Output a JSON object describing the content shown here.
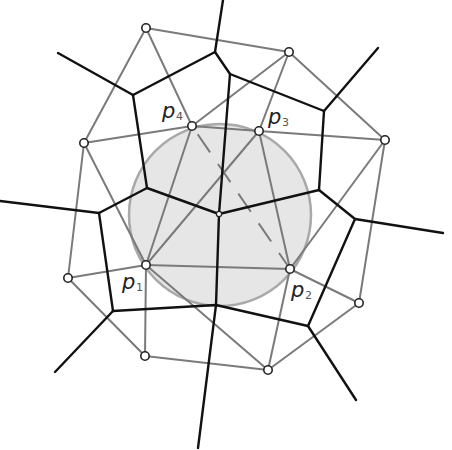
{
  "colors": {
    "voronoi": "#111111",
    "delaunay": "#7a7a7a",
    "circle_fill": "#e6e6e6",
    "circle_stroke": "#a9a9a9",
    "site_fill": "#ffffff",
    "site_stroke": "#222222",
    "dashed": "#7a7a7a"
  },
  "circle": {
    "cx": 220,
    "cy": 215,
    "r": 91
  },
  "sites": [
    {
      "id": "s_top",
      "x": 146,
      "y": 28
    },
    {
      "id": "s_topright",
      "x": 289,
      "y": 52
    },
    {
      "id": "s_left",
      "x": 84,
      "y": 143
    },
    {
      "id": "p4",
      "x": 192,
      "y": 126
    },
    {
      "id": "p3",
      "x": 259,
      "y": 131
    },
    {
      "id": "s_right",
      "x": 385,
      "y": 140
    },
    {
      "id": "p1",
      "x": 146,
      "y": 265
    },
    {
      "id": "p2",
      "x": 290,
      "y": 269
    },
    {
      "id": "s_farleft",
      "x": 68,
      "y": 278
    },
    {
      "id": "s_farright",
      "x": 359,
      "y": 303
    },
    {
      "id": "s_bottomleft",
      "x": 145,
      "y": 356
    },
    {
      "id": "s_bottom",
      "x": 268,
      "y": 370
    }
  ],
  "labels": [
    {
      "text": "p",
      "sub": "4",
      "x": 162,
      "y": 118
    },
    {
      "text": "p",
      "sub": "3",
      "x": 268,
      "y": 124
    },
    {
      "text": "p",
      "sub": "1",
      "x": 122,
      "y": 289
    },
    {
      "text": "p",
      "sub": "2",
      "x": 291,
      "y": 297
    }
  ],
  "delaunay_edges": [
    [
      146,
      28,
      289,
      52
    ],
    [
      146,
      28,
      84,
      143
    ],
    [
      146,
      28,
      192,
      126
    ],
    [
      289,
      52,
      192,
      126
    ],
    [
      289,
      52,
      259,
      131
    ],
    [
      289,
      52,
      385,
      140
    ],
    [
      84,
      143,
      192,
      126
    ],
    [
      84,
      143,
      68,
      278
    ],
    [
      84,
      143,
      146,
      265
    ],
    [
      192,
      126,
      259,
      131
    ],
    [
      192,
      126,
      146,
      265
    ],
    [
      259,
      131,
      385,
      140
    ],
    [
      259,
      131,
      146,
      265
    ],
    [
      259,
      131,
      290,
      269
    ],
    [
      385,
      140,
      290,
      269
    ],
    [
      385,
      140,
      359,
      303
    ],
    [
      146,
      265,
      290,
      269
    ],
    [
      146,
      265,
      68,
      278
    ],
    [
      146,
      265,
      145,
      356
    ],
    [
      146,
      265,
      268,
      370
    ],
    [
      290,
      269,
      359,
      303
    ],
    [
      290,
      269,
      268,
      370
    ],
    [
      68,
      278,
      145,
      356
    ],
    [
      145,
      356,
      268,
      370
    ],
    [
      268,
      370,
      359,
      303
    ]
  ],
  "dashed_edge": [
    192,
    126,
    290,
    269
  ],
  "voronoi_edges": [
    [
      219,
      214,
      230,
      74
    ],
    [
      219,
      214,
      147,
      188
    ],
    [
      219,
      214,
      319,
      190
    ],
    [
      219,
      214,
      216,
      305
    ],
    [
      230,
      74,
      215,
      52
    ],
    [
      230,
      74,
      324,
      111
    ],
    [
      215,
      52,
      133,
      95
    ],
    [
      215,
      52,
      223,
      0
    ],
    [
      133,
      95,
      147,
      188
    ],
    [
      133,
      95,
      58,
      53
    ],
    [
      147,
      188,
      99,
      213
    ],
    [
      99,
      213,
      0,
      201
    ],
    [
      99,
      213,
      113,
      311
    ],
    [
      113,
      311,
      216,
      305
    ],
    [
      113,
      311,
      55,
      372
    ],
    [
      216,
      305,
      308,
      326
    ],
    [
      216,
      305,
      198,
      448
    ],
    [
      308,
      326,
      355,
      219
    ],
    [
      308,
      326,
      356,
      400
    ],
    [
      355,
      219,
      319,
      190
    ],
    [
      355,
      219,
      443,
      233
    ],
    [
      319,
      190,
      324,
      111
    ],
    [
      324,
      111,
      378,
      48
    ]
  ],
  "voronoi_vertices_small": [
    {
      "x": 219,
      "y": 214
    }
  ]
}
